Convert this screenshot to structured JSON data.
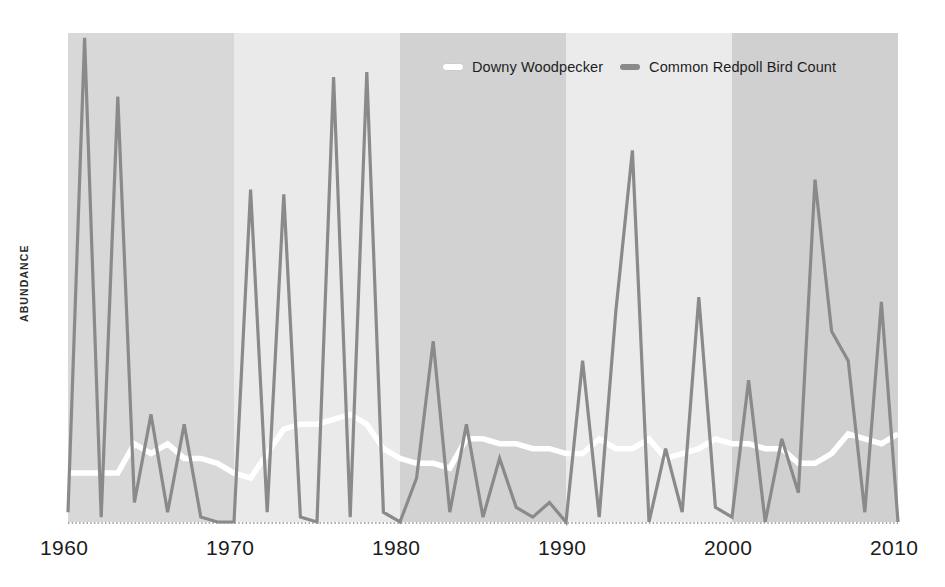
{
  "figure": {
    "background_color": "#ffffff",
    "plot_area": {
      "left": 68,
      "top": 33,
      "right": 898,
      "bottom": 522
    }
  },
  "axis": {
    "y_label": "ABUNDANCE",
    "x_ticks": [
      "1960",
      "1970",
      "1980",
      "1990",
      "2000",
      "2010"
    ],
    "baseline_style": "dotted"
  },
  "legend": {
    "position": "top-center-right",
    "entries": [
      {
        "label": "Downy Woodpecker",
        "color": "#ffffff",
        "marker": "line-swatch"
      },
      {
        "label": "Common Redpoll Bird Count",
        "color": "#8a8a8a",
        "marker": "line-swatch"
      }
    ]
  },
  "bands": {
    "decade_shading": [
      {
        "from": 1960,
        "to": 1970,
        "color": "#d8d8d8"
      },
      {
        "from": 1970,
        "to": 1980,
        "color": "#eaeaea"
      },
      {
        "from": 1980,
        "to": 1990,
        "color": "#d2d2d2"
      },
      {
        "from": 1990,
        "to": 2000,
        "color": "#ebebeb"
      },
      {
        "from": 2000,
        "to": 2010,
        "color": "#d0d0d0"
      }
    ]
  },
  "chart_data": {
    "type": "line",
    "title": "",
    "xlabel": "",
    "ylabel": "ABUNDANCE",
    "xlim": [
      1960,
      2010
    ],
    "ylim": [
      0,
      100
    ],
    "grid": false,
    "legend_position": "top",
    "x": [
      1960,
      1961,
      1962,
      1963,
      1964,
      1965,
      1966,
      1967,
      1968,
      1969,
      1970,
      1971,
      1972,
      1973,
      1974,
      1975,
      1976,
      1977,
      1978,
      1979,
      1980,
      1981,
      1982,
      1983,
      1984,
      1985,
      1986,
      1987,
      1988,
      1989,
      1990,
      1991,
      1992,
      1993,
      1994,
      1995,
      1996,
      1997,
      1998,
      1999,
      2000,
      2001,
      2002,
      2003,
      2004,
      2005,
      2006,
      2007,
      2008,
      2009,
      2010
    ],
    "series": [
      {
        "name": "Common Redpoll Bird Count",
        "color": "#8a8a8a",
        "linewidth": 3.2,
        "values": [
          2,
          99,
          1,
          87,
          4,
          22,
          2,
          20,
          1,
          0,
          0,
          68,
          2,
          67,
          1,
          0,
          91,
          1,
          92,
          2,
          0,
          9,
          37,
          2,
          20,
          1,
          13,
          3,
          1,
          4,
          0,
          33,
          1,
          43,
          76,
          0,
          15,
          2,
          46,
          3,
          1,
          29,
          0,
          17,
          6,
          70,
          39,
          33,
          2,
          45,
          0
        ]
      },
      {
        "name": "Downy Woodpecker",
        "color": "#ffffff",
        "linewidth": 5.5,
        "values": [
          10,
          10,
          10,
          10,
          16,
          14,
          16,
          13,
          13,
          12,
          10,
          9,
          14,
          19,
          20,
          20,
          21,
          22,
          20,
          15,
          13,
          12,
          12,
          11,
          17,
          17,
          16,
          16,
          15,
          15,
          14,
          14,
          17,
          15,
          15,
          17,
          13,
          14,
          15,
          17,
          16,
          16,
          15,
          15,
          12,
          12,
          14,
          18,
          17,
          16,
          18
        ]
      }
    ]
  }
}
